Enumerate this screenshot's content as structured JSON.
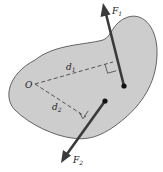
{
  "diagram": {
    "colors": {
      "body_fill": "#cdcdcd",
      "body_stroke": "#555555",
      "force_line": "#3a3a3a",
      "dashed_line": "#444444",
      "text": "#222222",
      "background": "#ffffff"
    },
    "labels": {
      "origin": "O",
      "force1": "F",
      "force1_sub": "1",
      "force2": "F",
      "force2_sub": "2",
      "arm1": "d",
      "arm1_sub": "1",
      "arm2": "d",
      "arm2_sub": "2"
    },
    "elements": {
      "origin_point": {
        "x": 35,
        "y": 84
      },
      "force1": {
        "tail": [
          124,
          86
        ],
        "head": [
          103,
          3
        ]
      },
      "force2": {
        "tail": [
          105,
          101
        ],
        "head": [
          61,
          163
        ]
      },
      "arm1_foot": [
        113,
        62
      ],
      "arm2_foot": [
        86,
        117
      ]
    }
  }
}
